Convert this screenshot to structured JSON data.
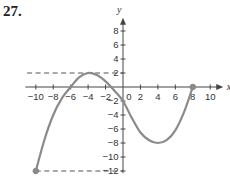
{
  "problem": {
    "number": "27."
  },
  "colors": {
    "axis": "#444444",
    "curve": "#8a8a8a",
    "dash": "#555555",
    "point": "#8a8a8a"
  },
  "chart_data": {
    "type": "line",
    "title": "",
    "xlabel": "x",
    "ylabel": "y",
    "xlim": [
      -11,
      11
    ],
    "ylim": [
      -12,
      9
    ],
    "grid": false,
    "x_ticks": [
      -10,
      -8,
      -6,
      -4,
      -2,
      0,
      2,
      4,
      6,
      8,
      10
    ],
    "x_tick_labels": [
      "−10",
      "−8",
      "−6",
      "−4",
      "−2",
      "0",
      "2",
      "4",
      "6",
      "8",
      "10"
    ],
    "y_ticks": [
      8,
      6,
      4,
      2,
      -2,
      -4,
      -6,
      -8,
      -10,
      -12
    ],
    "y_tick_labels": [
      "8",
      "6",
      "4",
      "2",
      "−2",
      "−4",
      "−6",
      "−8",
      "−10",
      "−12"
    ],
    "series": [
      {
        "name": "f(x)",
        "x": [
          -10,
          -9,
          -8,
          -7,
          -6,
          -5,
          -4,
          -3,
          -2,
          -1,
          0,
          1,
          2,
          3,
          4,
          5,
          6,
          7,
          8
        ],
        "y": [
          -12,
          -7.5,
          -4,
          -1.6,
          0,
          1.4,
          2,
          1.7,
          0.8,
          -0.5,
          -2,
          -4.4,
          -6.5,
          -7.6,
          -8,
          -7.6,
          -6.2,
          -3.6,
          0
        ]
      }
    ],
    "endpoints": [
      {
        "x": -10,
        "y": -12,
        "filled": true
      },
      {
        "x": 8,
        "y": 0,
        "filled": true
      }
    ],
    "dashed_lines": [
      {
        "y": 2,
        "x_from": -11,
        "x_to": 0,
        "label": "local maximum level"
      },
      {
        "y": -12,
        "x_from": -10,
        "x_to": 0,
        "label": "minimum level"
      }
    ],
    "annotations": [
      "local max ≈ (−4, 2)",
      "local min ≈ (4, −8)"
    ]
  }
}
